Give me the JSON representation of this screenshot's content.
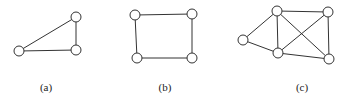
{
  "figure": {
    "panels": [
      {
        "label": "(a)",
        "label_pos": [
          46,
          81
        ],
        "nodes": [
          [
            19,
            51
          ],
          [
            76,
            17
          ],
          [
            76,
            50
          ]
        ],
        "edges": [
          [
            0,
            1
          ],
          [
            0,
            2
          ],
          [
            1,
            2
          ]
        ]
      },
      {
        "label": "(b)",
        "label_pos": [
          165,
          81
        ],
        "nodes": [
          [
            135,
            15
          ],
          [
            192,
            14
          ],
          [
            137,
            58
          ],
          [
            192,
            58
          ]
        ],
        "edges": [
          [
            0,
            1
          ],
          [
            0,
            2
          ],
          [
            1,
            3
          ],
          [
            2,
            3
          ]
        ]
      },
      {
        "label": "(c)",
        "label_pos": [
          302,
          81
        ],
        "nodes": [
          [
            277,
            11
          ],
          [
            328,
            12
          ],
          [
            243,
            40
          ],
          [
            278,
            53
          ],
          [
            329,
            59
          ]
        ],
        "edges": [
          [
            0,
            1
          ],
          [
            0,
            2
          ],
          [
            0,
            3
          ],
          [
            0,
            4
          ],
          [
            1,
            3
          ],
          [
            1,
            4
          ],
          [
            2,
            3
          ],
          [
            3,
            4
          ]
        ]
      }
    ],
    "node_radius": 5
  }
}
